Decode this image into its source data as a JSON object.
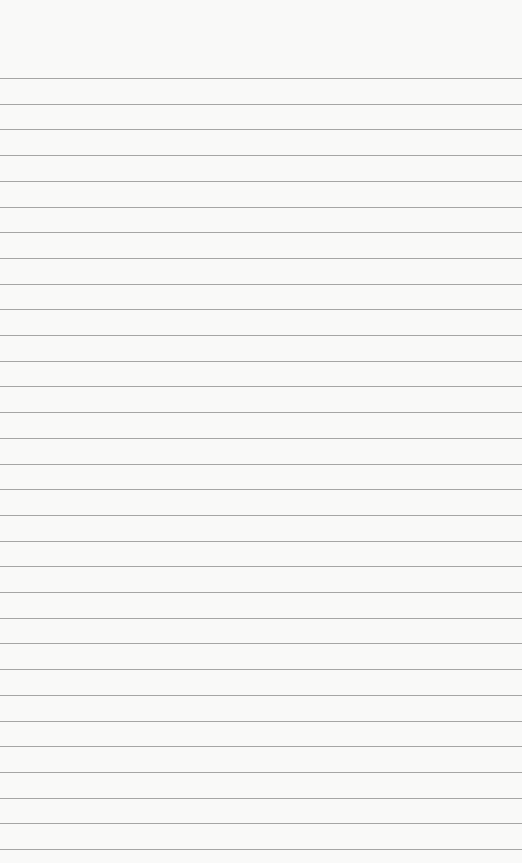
{
  "paper": {
    "background": "#f9f9f8",
    "line_color": "#8a8a8a",
    "line_count": 31,
    "first_line_y": 78,
    "line_spacing": 25.7
  }
}
